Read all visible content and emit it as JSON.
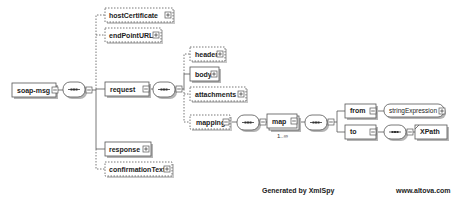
{
  "diagram": {
    "root": {
      "label": "soap-msg"
    },
    "level1": {
      "hostCertificate": {
        "label": "hostCertificate",
        "optional": true
      },
      "endPointURL": {
        "label": "endPointURL",
        "optional": true
      },
      "request": {
        "label": "request",
        "optional": false
      },
      "response": {
        "label": "response",
        "optional": false
      },
      "confirmationText": {
        "label": "confirmationText",
        "optional": true
      }
    },
    "request_children": {
      "header": {
        "label": "header",
        "optional": true
      },
      "body": {
        "label": "body",
        "optional": false
      },
      "attachments": {
        "label": "attachments",
        "optional": true
      },
      "mapping": {
        "label": "mapping",
        "optional": true
      }
    },
    "mapping_children": {
      "map": {
        "label": "map",
        "multiplicity": "1..∞"
      }
    },
    "map_children": {
      "from": {
        "label": "from",
        "type": "stringExpression"
      },
      "to": {
        "label": "to",
        "child": "XPath"
      }
    },
    "compositor_symbol": "sequence"
  },
  "footer": {
    "generated": "Generated by XmlSpy",
    "website": "www.altova.com"
  },
  "colors": {
    "line": "#555555",
    "box_fill": "#ffffff",
    "shadow": "#b5b5b5",
    "text": "#222222"
  }
}
